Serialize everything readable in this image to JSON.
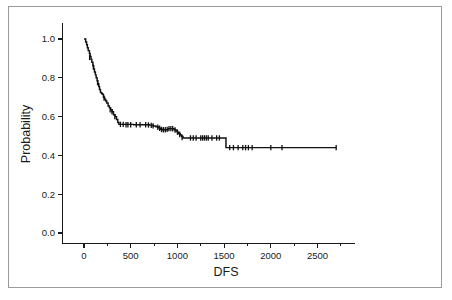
{
  "figure": {
    "background_color": "#ffffff",
    "border_color": "#9a9a9a",
    "curve_color": "#111111",
    "axis_color": "#1a1a1a"
  },
  "chart_data": {
    "type": "line",
    "title": "",
    "subtitle": "",
    "xlabel": "DFS",
    "ylabel": "Probability",
    "xlim": [
      -130,
      2900
    ],
    "ylim": [
      -0.05,
      1.08
    ],
    "grid": false,
    "legend": null,
    "xticks": [
      0,
      500,
      1000,
      1500,
      2000,
      2500
    ],
    "xtick_labels": [
      "0",
      "500",
      "1000",
      "1500",
      "2000",
      "2500"
    ],
    "xminor_ticks": [
      250,
      750,
      1250,
      1750,
      2250,
      2750
    ],
    "yticks": [
      0.0,
      0.2,
      0.4,
      0.6,
      0.8,
      1.0
    ],
    "ytick_labels": [
      "0.0",
      "0.2",
      "0.4",
      "0.6",
      "0.8",
      "1.0"
    ],
    "series": [
      {
        "name": "Disease-free survival",
        "style": "kaplan-meier-step",
        "x": [
          0,
          18,
          28,
          36,
          45,
          58,
          66,
          75,
          84,
          95,
          104,
          112,
          122,
          130,
          140,
          148,
          158,
          166,
          176,
          186,
          196,
          208,
          220,
          232,
          244,
          258,
          272,
          286,
          300,
          316,
          332,
          348,
          362,
          374,
          470,
          530,
          600,
          660,
          700,
          740,
          770,
          790,
          805,
          820,
          840,
          860,
          880,
          900,
          920,
          940,
          955,
          970,
          985,
          1000,
          1015,
          1030,
          1045,
          1060,
          1500,
          1520,
          2700
        ],
        "y": [
          1.0,
          0.985,
          0.97,
          0.955,
          0.94,
          0.925,
          0.91,
          0.895,
          0.88,
          0.862,
          0.845,
          0.83,
          0.815,
          0.8,
          0.785,
          0.77,
          0.755,
          0.74,
          0.725,
          0.72,
          0.715,
          0.7,
          0.69,
          0.68,
          0.67,
          0.655,
          0.645,
          0.635,
          0.625,
          0.61,
          0.6,
          0.585,
          0.57,
          0.56,
          0.56,
          0.558,
          0.558,
          0.558,
          0.556,
          0.552,
          0.548,
          0.545,
          0.54,
          0.535,
          0.532,
          0.532,
          0.532,
          0.538,
          0.538,
          0.538,
          0.536,
          0.532,
          0.526,
          0.52,
          0.512,
          0.505,
          0.497,
          0.49,
          0.49,
          0.44,
          0.44
        ],
        "censor_times": [
          60,
          100,
          145,
          215,
          280,
          300,
          330,
          390,
          420,
          450,
          470,
          500,
          560,
          600,
          660,
          690,
          720,
          740,
          790,
          810,
          830,
          850,
          870,
          890,
          910,
          930,
          950,
          975,
          1000,
          1025,
          1050,
          1140,
          1170,
          1200,
          1250,
          1270,
          1290,
          1310,
          1330,
          1370,
          1420,
          1450,
          1560,
          1600,
          1650,
          1700,
          1730,
          1760,
          1800,
          2000,
          2120,
          2700
        ],
        "censor_values": [
          0.905,
          0.855,
          0.775,
          0.695,
          0.635,
          0.625,
          0.6,
          0.56,
          0.56,
          0.558,
          0.558,
          0.558,
          0.558,
          0.558,
          0.558,
          0.557,
          0.555,
          0.552,
          0.545,
          0.54,
          0.534,
          0.532,
          0.532,
          0.534,
          0.538,
          0.538,
          0.537,
          0.531,
          0.52,
          0.508,
          0.492,
          0.49,
          0.49,
          0.49,
          0.49,
          0.49,
          0.49,
          0.49,
          0.49,
          0.49,
          0.49,
          0.49,
          0.44,
          0.44,
          0.44,
          0.44,
          0.44,
          0.44,
          0.44,
          0.44,
          0.44,
          0.44
        ]
      }
    ]
  }
}
